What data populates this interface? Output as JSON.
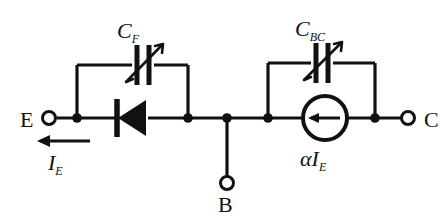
{
  "figure": {
    "type": "circuit-diagram",
    "background_color": "#ffffff",
    "line_color": "#111111"
  },
  "terminals": [
    {
      "id": "emitter",
      "label": "E",
      "x": 48,
      "y": 118,
      "side": "left"
    },
    {
      "id": "base",
      "label": "B",
      "x": 227,
      "y": 186,
      "side": "bottom"
    },
    {
      "id": "collector",
      "label": "C",
      "x": 410,
      "y": 118,
      "side": "right"
    }
  ],
  "components": [
    {
      "id": "cf",
      "type": "variable-capacitor",
      "label": "C",
      "subscript": "F",
      "label_full": "CF",
      "x": 143,
      "y": 65
    },
    {
      "id": "diode",
      "type": "diode",
      "orientation": "points-left",
      "x": 133,
      "y": 118
    },
    {
      "id": "cbc",
      "type": "variable-capacitor",
      "label": "C",
      "subscript": "BC",
      "label_full": "CBC",
      "x": 322,
      "y": 63
    },
    {
      "id": "current-source",
      "type": "dependent-current-source",
      "arrow_direction": "left",
      "label": "αI",
      "subscript": "E",
      "label_full": "αIE",
      "x": 325,
      "y": 118
    }
  ],
  "annotations": [
    {
      "id": "ie-arrow",
      "type": "current-arrow",
      "direction": "left",
      "label": "I",
      "subscript": "E",
      "label_full": "IE",
      "x": 63,
      "y": 140
    }
  ],
  "labels": {
    "emitter": "E",
    "base": "B",
    "collector": "C",
    "cf_main": "C",
    "cf_sub": "F",
    "cbc_main": "C",
    "cbc_sub": "BC",
    "alpha_ie_main": "αI",
    "alpha_ie_sub": "E",
    "ie_main": "I",
    "ie_sub": "E"
  }
}
